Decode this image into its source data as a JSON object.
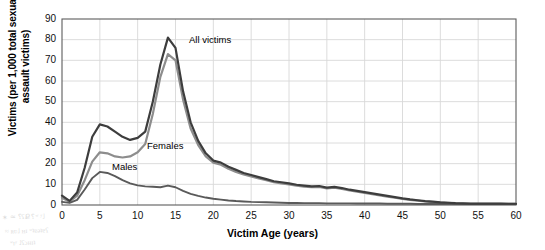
{
  "chart_data": {
    "type": "line",
    "title": "",
    "xlabel": "Victim Age (years)",
    "ylabel": "Victims (per 1,000 total sexual assault victims)",
    "ylabel_line1": "Victims (per 1,000 total sexual",
    "ylabel_line2": "assault victims)",
    "xlim": [
      0,
      60
    ],
    "ylim": [
      0,
      90
    ],
    "xticks": [
      "0",
      "5",
      "10",
      "15",
      "20",
      "25",
      "30",
      "35",
      "40",
      "45",
      "50",
      "55",
      "60"
    ],
    "yticks": [
      "0",
      "10",
      "20",
      "30",
      "40",
      "50",
      "60",
      "70",
      "80",
      "90"
    ],
    "grid": true,
    "legend_position": "inline-annotations",
    "x": [
      0,
      1,
      2,
      3,
      4,
      5,
      6,
      7,
      8,
      9,
      10,
      11,
      12,
      13,
      14,
      15,
      16,
      17,
      18,
      19,
      20,
      21,
      22,
      23,
      24,
      25,
      26,
      27,
      28,
      29,
      30,
      31,
      32,
      33,
      34,
      35,
      36,
      37,
      38,
      39,
      40,
      41,
      42,
      43,
      44,
      45,
      46,
      47,
      48,
      49,
      50,
      51,
      52,
      53,
      54,
      55,
      56,
      57,
      58,
      59,
      60
    ],
    "series": [
      {
        "name": "All victims",
        "color": "#3d3d3d",
        "values": [
          4.5,
          2.0,
          6.0,
          18.0,
          33.0,
          39.0,
          38.0,
          35.5,
          33.0,
          31.5,
          32.5,
          35.5,
          50.0,
          68.0,
          81.0,
          76.0,
          55.0,
          40.0,
          31.0,
          25.0,
          21.5,
          20.5,
          18.5,
          17.0,
          15.5,
          14.5,
          13.5,
          12.5,
          11.5,
          11.0,
          10.5,
          9.8,
          9.4,
          9.0,
          9.2,
          8.4,
          8.8,
          8.2,
          7.4,
          6.8,
          6.2,
          5.6,
          5.0,
          4.4,
          3.8,
          3.2,
          2.7,
          2.3,
          1.9,
          1.6,
          1.3,
          1.1,
          0.9,
          0.8,
          0.7,
          0.7,
          0.7,
          0.7,
          0.7,
          0.6,
          0.6
        ]
      },
      {
        "name": "Females",
        "color": "#8d8d8d",
        "values": [
          3.5,
          1.6,
          4.5,
          12.0,
          21.0,
          25.5,
          25.0,
          23.5,
          23.0,
          23.5,
          25.5,
          29.5,
          44.0,
          62.0,
          73.0,
          70.0,
          51.0,
          37.0,
          29.0,
          23.5,
          20.5,
          19.5,
          17.5,
          16.0,
          14.8,
          13.8,
          12.8,
          12.0,
          11.0,
          10.4,
          10.0,
          9.3,
          8.9,
          8.6,
          8.8,
          8.0,
          8.4,
          7.8,
          7.0,
          6.4,
          5.8,
          5.2,
          4.6,
          4.0,
          3.5,
          3.0,
          2.5,
          2.1,
          1.7,
          1.4,
          1.2,
          1.0,
          0.8,
          0.7,
          0.6,
          0.6,
          0.6,
          0.6,
          0.6,
          0.5,
          0.5
        ]
      },
      {
        "name": "Males",
        "color": "#5a5a5a",
        "values": [
          1.5,
          1.0,
          2.5,
          7.5,
          13.0,
          16.0,
          15.5,
          14.0,
          12.0,
          10.5,
          9.5,
          9.0,
          8.8,
          8.6,
          9.4,
          8.6,
          6.8,
          5.4,
          4.4,
          3.6,
          3.0,
          2.6,
          2.2,
          1.9,
          1.7,
          1.5,
          1.4,
          1.3,
          1.2,
          1.1,
          1.0,
          1.0,
          0.9,
          0.9,
          0.9,
          0.8,
          0.8,
          0.8,
          0.8,
          0.7,
          0.7,
          0.7,
          0.7,
          0.6,
          0.6,
          0.6,
          0.6,
          0.5,
          0.5,
          0.5,
          0.5,
          0.5,
          0.5,
          0.5,
          0.5,
          0.5,
          0.5,
          0.5,
          0.5,
          0.5,
          0.5
        ]
      }
    ],
    "annotations": [
      {
        "text": "All victims",
        "x_px": 189,
        "y_px": 34
      },
      {
        "text": "Females",
        "x_px": 147,
        "y_px": 140
      },
      {
        "text": "Males",
        "x_px": 112,
        "y_px": 161
      }
    ]
  },
  "artifacts": [
    {
      "text": "✶ ≃ ⸮ʕՔ  ⸮ʷ ʸ˩",
      "x_px": 2,
      "y_px": 213
    },
    {
      "text": "≈ ʀʋ˩ ʜɪ ʷʇɐǝʇɐʕ",
      "x_px": 5,
      "y_px": 227
    },
    {
      "text": "ʷɪʸ ˩ʕɔʜɪʇ",
      "x_px": 10,
      "y_px": 239
    }
  ],
  "colors": {
    "frame": "#5c5c5c",
    "grid": "#d8d8d8",
    "background": "#ffffff",
    "text": "#000000"
  }
}
